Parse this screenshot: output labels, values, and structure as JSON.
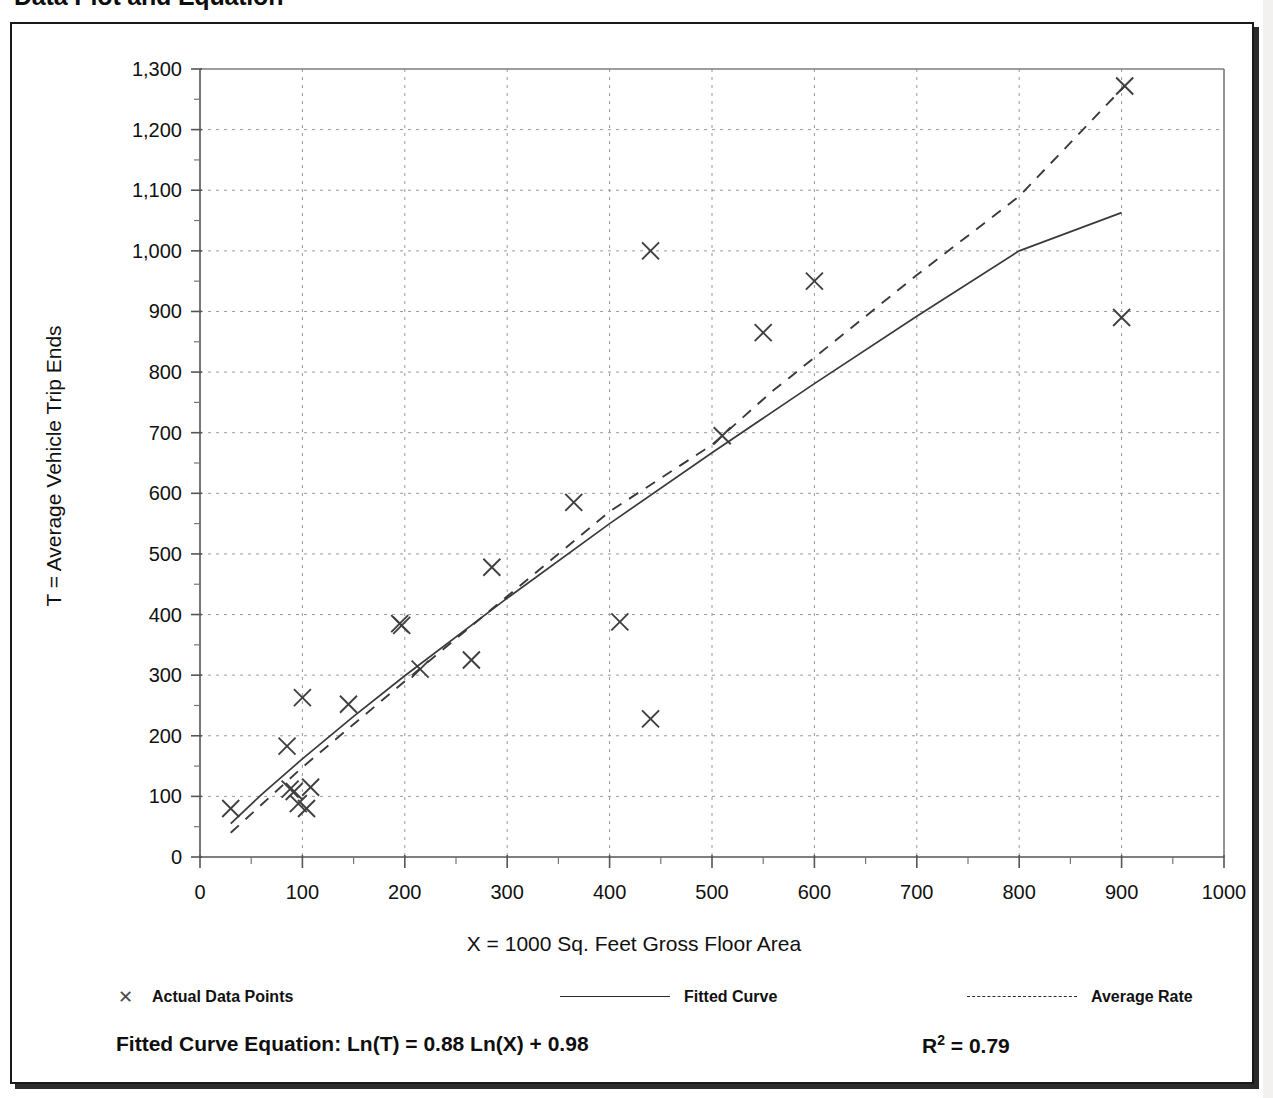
{
  "page": {
    "title": "Data Plot and Equation"
  },
  "chart_data": {
    "type": "scatter",
    "title": "Data Plot and Equation",
    "xlabel": "X = 1000 Sq. Feet Gross Floor Area",
    "ylabel": "T = Average Vehicle Trip Ends",
    "xlim": [
      0,
      1000
    ],
    "ylim": [
      0,
      1300
    ],
    "x_ticks": [
      0,
      100,
      200,
      300,
      400,
      500,
      600,
      700,
      800,
      900,
      1000
    ],
    "x_tick_labels": [
      "0",
      "100",
      "200",
      "300",
      "400",
      "500",
      "600",
      "700",
      "800",
      "900",
      "1000"
    ],
    "x_minor_tick_step": 50,
    "y_ticks": [
      0,
      100,
      200,
      300,
      400,
      500,
      600,
      700,
      800,
      900,
      1000,
      1100,
      1200,
      1300
    ],
    "y_tick_labels": [
      "0",
      "100",
      "200",
      "300",
      "400",
      "500",
      "600",
      "700",
      "800",
      "900",
      "1,000",
      "1,100",
      "1,200",
      "1,300"
    ],
    "y_minor_tick_step": 50,
    "grid": "dotted-both-axes",
    "legend_position": "below-plot",
    "series": [
      {
        "name": "Actual Data Points",
        "type": "scatter",
        "marker": "x",
        "points": [
          [
            30,
            80
          ],
          [
            85,
            183
          ],
          [
            88,
            112
          ],
          [
            92,
            108
          ],
          [
            96,
            88
          ],
          [
            100,
            263
          ],
          [
            104,
            80
          ],
          [
            108,
            115
          ],
          [
            145,
            252
          ],
          [
            195,
            385
          ],
          [
            197,
            382
          ],
          [
            215,
            310
          ],
          [
            265,
            325
          ],
          [
            285,
            478
          ],
          [
            365,
            585
          ],
          [
            410,
            388
          ],
          [
            440,
            1000
          ],
          [
            440,
            228
          ],
          [
            510,
            695
          ],
          [
            550,
            865
          ],
          [
            600,
            950
          ],
          [
            900,
            890
          ],
          [
            903,
            1272
          ]
        ]
      },
      {
        "name": "Fitted Curve",
        "type": "line",
        "style": "solid",
        "equation": "Ln(T) = 0.88 Ln(X) + 0.98",
        "points": [
          [
            30,
            55
          ],
          [
            60,
            103
          ],
          [
            100,
            162
          ],
          [
            150,
            232
          ],
          [
            200,
            299
          ],
          [
            300,
            427
          ],
          [
            400,
            550
          ],
          [
            500,
            667
          ],
          [
            600,
            781
          ],
          [
            700,
            892
          ],
          [
            800,
            1000
          ],
          [
            900,
            1063
          ]
        ]
      },
      {
        "name": "Average Rate",
        "type": "line",
        "style": "dashed",
        "points": [
          [
            30,
            40
          ],
          [
            100,
            148
          ],
          [
            200,
            290
          ],
          [
            300,
            430
          ],
          [
            400,
            570
          ],
          [
            500,
            680
          ],
          [
            560,
            770
          ],
          [
            575,
            790
          ],
          [
            700,
            960
          ],
          [
            800,
            1090
          ],
          [
            903,
            1272
          ]
        ]
      }
    ],
    "annotations": {
      "equation_label": "Fitted Curve Equation:",
      "equation": "Ln(T) = 0.88 Ln(X) + 0.98",
      "r_squared_label": "R",
      "r_squared_exponent": "2",
      "r_squared_value": "= 0.79",
      "r_squared_full": "R² = 0.79"
    }
  },
  "legend": {
    "entries": [
      {
        "label": "Actual Data Points",
        "icon": "x-marker-icon"
      },
      {
        "label": "Fitted Curve",
        "icon": "solid-line-icon"
      },
      {
        "label": "Average Rate",
        "icon": "dashed-line-icon"
      }
    ]
  },
  "equation_row": {
    "label": "Fitted Curve Equation:  Ln(T) = 0.88 Ln(X) + 0.98",
    "r_prefix": "R",
    "r_exponent": "2",
    "r_suffix": " = 0.79"
  }
}
